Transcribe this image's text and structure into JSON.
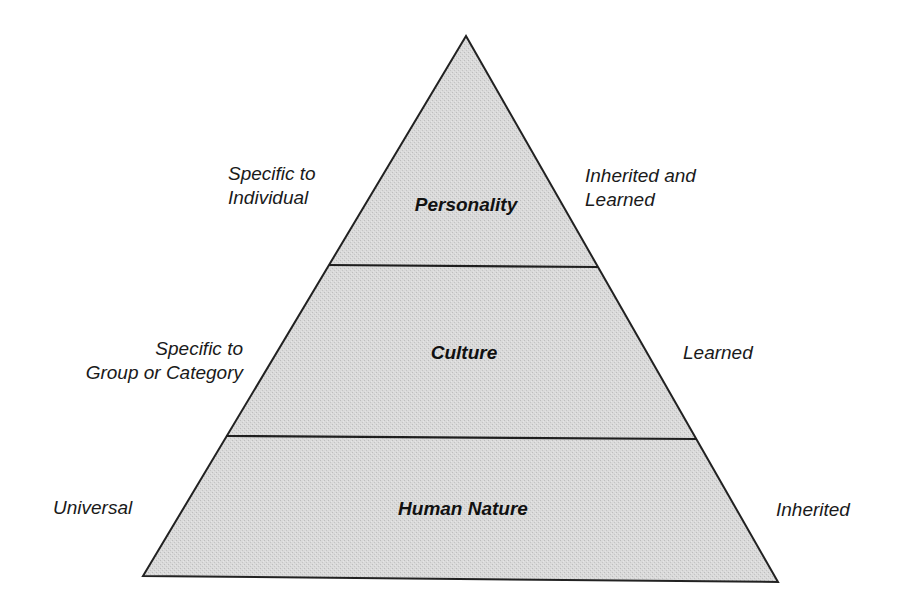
{
  "diagram": {
    "type": "pyramid",
    "colors": {
      "fill": "#d6d6d6",
      "stroke": "#222222",
      "text": "#111111"
    },
    "tiers": [
      {
        "name": "Personality",
        "left_label": [
          "Specific to",
          "Individual"
        ],
        "right_label": [
          "Inherited and",
          "Learned"
        ]
      },
      {
        "name": "Culture",
        "left_label": [
          "Specific to",
          "Group or Category"
        ],
        "right_label": [
          "Learned"
        ]
      },
      {
        "name": "Human Nature",
        "left_label": [
          "Universal"
        ],
        "right_label": [
          "Inherited"
        ]
      }
    ]
  }
}
